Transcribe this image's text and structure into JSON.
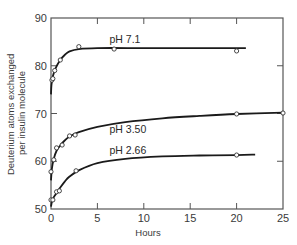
{
  "chart_data": {
    "type": "line",
    "title": "",
    "xlabel": "Hours",
    "ylabel": "Deuterium atoms exchanged per insulin molecule",
    "ylabel_lines": [
      "Deuterium atoms exchanged",
      "per insulin molecule"
    ],
    "xlim": [
      0,
      25
    ],
    "ylim": [
      50,
      90
    ],
    "x_ticks": [
      0,
      5,
      10,
      15,
      20,
      25
    ],
    "x_tick_labels": [
      "0",
      "5",
      "10",
      "15",
      "20",
      "25"
    ],
    "y_ticks": [
      50,
      60,
      70,
      80,
      90
    ],
    "y_tick_labels": [
      "50",
      "60",
      "70",
      "80",
      "90"
    ],
    "grid": false,
    "legend": "inline labels on curves",
    "series": [
      {
        "name": "pH 7.1",
        "points": [
          [
            0.1,
            77.0
          ],
          [
            0.2,
            77.3
          ],
          [
            0.4,
            79.0
          ],
          [
            1.0,
            81.2
          ],
          [
            3.0,
            84.0
          ],
          [
            6.8,
            83.5
          ],
          [
            20.0,
            83.1
          ]
        ],
        "curve": [
          [
            0,
            74
          ],
          [
            0.05,
            76
          ],
          [
            0.2,
            77.8
          ],
          [
            0.5,
            79.5
          ],
          [
            1,
            81.2
          ],
          [
            1.5,
            82.3
          ],
          [
            2,
            83.0
          ],
          [
            3,
            83.5
          ],
          [
            5,
            83.7
          ],
          [
            10,
            83.7
          ],
          [
            15,
            83.7
          ],
          [
            21,
            83.7
          ]
        ]
      },
      {
        "name": "pH 3.50",
        "points": [
          [
            0.0,
            57.8
          ],
          [
            0.3,
            60.3
          ],
          [
            0.6,
            62.8
          ],
          [
            1.2,
            63.4
          ],
          [
            2.0,
            65.3
          ],
          [
            2.6,
            65.5
          ],
          [
            20.0,
            69.9
          ],
          [
            25.0,
            70.1
          ]
        ],
        "curve": [
          [
            0,
            56
          ],
          [
            0.1,
            58.5
          ],
          [
            0.3,
            60.5
          ],
          [
            0.6,
            62.2
          ],
          [
            1,
            63.3
          ],
          [
            1.5,
            64.4
          ],
          [
            2,
            65.2
          ],
          [
            3,
            66.1
          ],
          [
            5,
            67.2
          ],
          [
            8,
            68.2
          ],
          [
            12,
            69.0
          ],
          [
            16,
            69.5
          ],
          [
            20,
            69.9
          ],
          [
            25,
            70.2
          ]
        ]
      },
      {
        "name": "pH 2.66",
        "points": [
          [
            0.0,
            51.9
          ],
          [
            0.2,
            51.9
          ],
          [
            0.6,
            53.6
          ],
          [
            0.9,
            53.8
          ],
          [
            2.7,
            58.0
          ],
          [
            20.0,
            61.3
          ]
        ],
        "curve": [
          [
            0,
            50.5
          ],
          [
            0.1,
            51.5
          ],
          [
            0.3,
            52.5
          ],
          [
            0.7,
            53.6
          ],
          [
            1,
            54.5
          ],
          [
            1.5,
            55.8
          ],
          [
            2,
            56.8
          ],
          [
            3,
            58.1
          ],
          [
            5,
            59.6
          ],
          [
            8,
            60.5
          ],
          [
            12,
            61.0
          ],
          [
            16,
            61.2
          ],
          [
            20,
            61.3
          ],
          [
            22,
            61.4
          ]
        ]
      }
    ],
    "series_labels": [
      {
        "text": "pH 7.1",
        "x": 6.3,
        "y": 84.7
      },
      {
        "text": "pH 3.50",
        "x": 6.3,
        "y": 66.0
      },
      {
        "text": "pH 2.66",
        "x": 6.3,
        "y": 61.6
      }
    ]
  }
}
